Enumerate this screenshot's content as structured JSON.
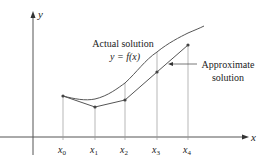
{
  "figure": {
    "axes": {
      "x_label": "x",
      "y_label": "y"
    },
    "ticks": [
      {
        "base": "x",
        "sub": "0"
      },
      {
        "base": "x",
        "sub": "1"
      },
      {
        "base": "x",
        "sub": "2"
      },
      {
        "base": "x",
        "sub": "3"
      },
      {
        "base": "x",
        "sub": "4"
      }
    ],
    "annotations": {
      "actual_line1": "Actual solution",
      "actual_line2": "y = f(x)",
      "approx_line1": "Approximate",
      "approx_line2": "solution"
    },
    "colors": {
      "stroke": "#555555",
      "text": "#222222"
    }
  }
}
